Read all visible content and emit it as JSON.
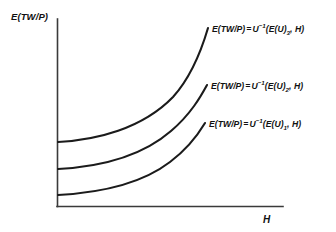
{
  "figure": {
    "name": "expected-real-total-wealth-vs-health-curves",
    "background_color": "#ffffff",
    "ink_color": "#1b1b1b",
    "axis_color": "#3a3a3a"
  },
  "axes": {
    "y_label": "E(TW/P)",
    "x_label": "H",
    "y_axis_x": 57,
    "y_axis_top": 19,
    "x_axis_y": 206,
    "x_axis_right": 283
  },
  "curve_labels": [
    {
      "id": "curve-label-1",
      "lhs": "E(TW/P)",
      "operator": "=",
      "fn": "U",
      "exponent": "−1",
      "arg_open": "(",
      "arg_main": "E(U)",
      "arg_subscript": "1",
      "arg_sep": ", ",
      "arg_second": "H",
      "arg_close": ")"
    },
    {
      "id": "curve-label-2",
      "lhs": "E(TW/P)",
      "operator": "=",
      "fn": "U",
      "exponent": "−1",
      "arg_open": "(",
      "arg_main": "E(U)",
      "arg_subscript": "2",
      "arg_sep": ", ",
      "arg_second": "H",
      "arg_close": ")"
    },
    {
      "id": "curve-label-3",
      "lhs": "E(TW/P)",
      "operator": "=",
      "fn": "U",
      "exponent": "−1",
      "arg_open": "(",
      "arg_main": "E(U)",
      "arg_subscript": "3",
      "arg_sep": ", ",
      "arg_second": "H",
      "arg_close": ")"
    }
  ],
  "chart_data": {
    "type": "line",
    "title": "",
    "xlabel": "H",
    "ylabel": "E(TW/P)",
    "grid": false,
    "legend": "inline-curve-labels",
    "xlim": [
      57,
      283
    ],
    "ylim": [
      206,
      19
    ],
    "axis_units": "pixel-coordinates (unlabelled qualitative axes)",
    "series": [
      {
        "name": "E(TW/P) = U^-1(E(U)_1, H)",
        "subscript": "1",
        "path": "M 58 195 C 95 193, 140 185, 170 162 C 190 147, 199 133, 205 123",
        "start_point": [
          58,
          195
        ],
        "end_point": [
          205,
          123
        ],
        "shape": "convex-increasing"
      },
      {
        "name": "E(TW/P) = U^-1(E(U)_2, H)",
        "subscript": "2",
        "path": "M 58 169 C 95 167, 140 158, 171 131 C 191 114, 201 96, 207 85",
        "start_point": [
          58,
          169
        ],
        "end_point": [
          207,
          85
        ],
        "shape": "convex-increasing"
      },
      {
        "name": "E(TW/P) = U^-1(E(U)_3, H)",
        "subscript": "3",
        "path": "M 58 142 C 96 140, 142 129, 173 97 C 192 76, 203 45, 208 28",
        "start_point": [
          58,
          142
        ],
        "end_point": [
          208,
          28
        ],
        "shape": "convex-increasing"
      }
    ]
  }
}
